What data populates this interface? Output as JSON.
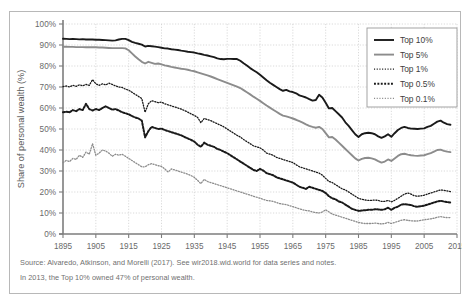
{
  "figure": {
    "ylabel": "Share of personal wealth (%)",
    "source_line": "Source: Alvaredo, Atkinson, and Morelli (2017). See wir2018.wid.world for data series and notes.",
    "note_line": "In 2013, the Top 10% owned 47% of personal wealth."
  },
  "colors": {
    "black": "#1a1a1a",
    "gray": "#8c8c8c",
    "grid": "#d0d0d0",
    "axis": "#7d7d7d",
    "frame": "#b8b8b8",
    "text": "#6a6a6a",
    "footnote": "#6f6f6f"
  },
  "legend": {
    "position": "top-right",
    "entries": [
      {
        "label": "Top 10%",
        "style": "solid-thick",
        "color": "#1a1a1a"
      },
      {
        "label": "Top 5%",
        "style": "solid-thick",
        "color": "#8c8c8c"
      },
      {
        "label": "Top 1%",
        "style": "fine-dotted",
        "color": "#1a1a1a"
      },
      {
        "label": "Top 0.5%",
        "style": "bold-dotted",
        "color": "#1a1a1a"
      },
      {
        "label": "Top 0.1%",
        "style": "fine-dotted",
        "color": "#8c8c8c"
      }
    ]
  },
  "chart_data": {
    "type": "line",
    "title": "",
    "xlabel": "",
    "ylabel": "Share of personal wealth (%)",
    "xlim": [
      1895,
      2015
    ],
    "ylim": [
      0,
      100
    ],
    "grid": true,
    "legend_position": "top-right",
    "xticks": [
      1895,
      1905,
      1915,
      1925,
      1935,
      1945,
      1955,
      1965,
      1975,
      1985,
      1995,
      2005,
      2015
    ],
    "ytick_labels": [
      "0%",
      "10%",
      "20%",
      "30%",
      "40%",
      "50%",
      "60%",
      "70%",
      "80%",
      "90%",
      "100%"
    ],
    "yticks": [
      0,
      10,
      20,
      30,
      40,
      50,
      60,
      70,
      80,
      90,
      100
    ],
    "x": [
      1895,
      1896,
      1897,
      1898,
      1899,
      1900,
      1901,
      1902,
      1903,
      1904,
      1905,
      1906,
      1907,
      1908,
      1909,
      1910,
      1911,
      1912,
      1913,
      1914,
      1915,
      1916,
      1917,
      1918,
      1919,
      1920,
      1921,
      1922,
      1923,
      1924,
      1925,
      1926,
      1927,
      1928,
      1929,
      1930,
      1931,
      1932,
      1933,
      1934,
      1935,
      1936,
      1937,
      1938,
      1939,
      1940,
      1941,
      1942,
      1943,
      1944,
      1945,
      1946,
      1947,
      1948,
      1949,
      1950,
      1951,
      1952,
      1953,
      1954,
      1955,
      1956,
      1957,
      1958,
      1959,
      1960,
      1961,
      1962,
      1963,
      1964,
      1965,
      1966,
      1967,
      1968,
      1969,
      1970,
      1971,
      1972,
      1973,
      1974,
      1975,
      1976,
      1977,
      1978,
      1979,
      1980,
      1981,
      1982,
      1983,
      1984,
      1985,
      1986,
      1987,
      1988,
      1989,
      1990,
      1991,
      1992,
      1993,
      1994,
      1995,
      1996,
      1997,
      1998,
      1999,
      2000,
      2001,
      2002,
      2003,
      2004,
      2005,
      2006,
      2007,
      2008,
      2009,
      2010,
      2011,
      2012,
      2013
    ],
    "series": [
      {
        "name": "Top 10%",
        "color": "#1a1a1a",
        "style": "solid-thick",
        "values": [
          93.0,
          92.9,
          92.8,
          92.9,
          92.8,
          92.7,
          92.8,
          92.6,
          92.6,
          92.6,
          92.5,
          92.5,
          92.4,
          92.3,
          92.2,
          92.1,
          92.2,
          92.6,
          92.9,
          92.9,
          92.3,
          91.5,
          91.0,
          90.6,
          90.2,
          89.3,
          89.6,
          89.4,
          89.2,
          89.0,
          88.7,
          88.4,
          88.3,
          88.0,
          87.8,
          87.6,
          87.3,
          87.1,
          86.8,
          86.6,
          86.4,
          86.0,
          85.7,
          85.3,
          85.0,
          84.6,
          84.2,
          83.6,
          83.3,
          83.2,
          83.4,
          83.4,
          83.3,
          83.3,
          82.5,
          81.3,
          80.2,
          79.0,
          78.0,
          77.0,
          75.8,
          74.5,
          73.2,
          72.0,
          71.0,
          70.0,
          69.0,
          68.2,
          68.6,
          67.9,
          67.6,
          67.0,
          66.0,
          65.5,
          65.0,
          64.2,
          63.5,
          63.8,
          66.3,
          65.0,
          62.5,
          59.8,
          60.0,
          58.5,
          57.0,
          55.5,
          53.2,
          51.5,
          49.5,
          47.5,
          46.2,
          47.5,
          48.0,
          48.2,
          48.0,
          47.5,
          46.5,
          45.8,
          46.5,
          47.5,
          46.3,
          48.0,
          49.5,
          50.5,
          51.0,
          50.5,
          50.2,
          50.1,
          50.0,
          50.2,
          50.3,
          51.0,
          51.5,
          52.5,
          53.5,
          54.0,
          53.0,
          52.3,
          52.0
        ]
      },
      {
        "name": "Top 5%",
        "color": "#8c8c8c",
        "style": "solid-thick",
        "values": [
          89.2,
          89.2,
          89.1,
          89.1,
          89.0,
          89.0,
          89.0,
          88.9,
          88.9,
          88.9,
          88.9,
          88.8,
          88.8,
          88.7,
          88.6,
          88.5,
          88.5,
          88.5,
          88.5,
          88.4,
          87.5,
          86.0,
          84.5,
          83.2,
          82.0,
          81.2,
          82.0,
          81.5,
          81.0,
          81.2,
          80.8,
          80.3,
          80.0,
          79.6,
          79.3,
          79.0,
          78.7,
          78.5,
          78.2,
          77.8,
          77.5,
          77.0,
          76.5,
          76.0,
          75.5,
          75.0,
          74.4,
          73.8,
          73.2,
          72.6,
          72.0,
          71.4,
          70.8,
          70.2,
          69.5,
          68.5,
          67.5,
          66.5,
          65.4,
          64.4,
          63.4,
          62.3,
          61.2,
          60.2,
          59.2,
          58.2,
          57.2,
          56.4,
          56.0,
          55.5,
          55.0,
          54.4,
          53.7,
          53.0,
          52.2,
          51.5,
          51.0,
          50.6,
          51.0,
          50.0,
          48.0,
          46.0,
          46.2,
          45.0,
          43.5,
          42.0,
          40.5,
          39.0,
          37.5,
          36.0,
          35.0,
          35.8,
          36.2,
          36.3,
          36.0,
          35.5,
          34.7,
          34.0,
          34.5,
          35.5,
          34.8,
          36.0,
          37.2,
          38.0,
          38.2,
          37.8,
          37.5,
          37.3,
          37.2,
          37.4,
          37.5,
          38.0,
          38.5,
          39.2,
          40.0,
          40.2,
          39.6,
          39.2,
          39.0
        ]
      },
      {
        "name": "Top 1%",
        "color": "#1a1a1a",
        "style": "fine-dotted",
        "values": [
          70.2,
          70.5,
          70.0,
          70.8,
          70.3,
          71.0,
          70.6,
          71.2,
          70.8,
          73.5,
          71.5,
          70.8,
          71.5,
          71.0,
          71.8,
          71.2,
          70.5,
          70.0,
          69.8,
          69.0,
          68.5,
          67.5,
          66.5,
          65.5,
          64.5,
          58.0,
          62.0,
          63.5,
          63.0,
          62.5,
          62.8,
          62.0,
          61.5,
          61.0,
          60.5,
          60.0,
          59.5,
          58.8,
          58.0,
          57.2,
          56.5,
          55.5,
          53.0,
          55.0,
          54.5,
          54.0,
          53.2,
          52.5,
          51.8,
          51.0,
          50.0,
          49.0,
          48.0,
          47.0,
          46.2,
          45.0,
          44.0,
          43.0,
          42.0,
          41.5,
          41.0,
          40.0,
          38.5,
          38.0,
          37.5,
          36.5,
          36.0,
          35.5,
          35.0,
          34.5,
          34.0,
          33.0,
          32.0,
          31.5,
          31.0,
          30.5,
          30.0,
          29.5,
          29.0,
          28.0,
          26.5,
          25.0,
          24.5,
          23.5,
          22.5,
          21.5,
          21.0,
          20.0,
          19.0,
          18.0,
          17.0,
          16.5,
          16.2,
          16.0,
          16.0,
          16.2,
          16.0,
          15.5,
          15.5,
          16.0,
          15.3,
          16.0,
          17.0,
          18.0,
          19.0,
          19.5,
          19.0,
          18.2,
          18.0,
          18.2,
          18.5,
          19.0,
          19.5,
          20.0,
          20.5,
          21.0,
          20.8,
          20.5,
          20.2
        ]
      },
      {
        "name": "Top 0.5%",
        "color": "#1a1a1a",
        "style": "bold-dotted",
        "values": [
          58.0,
          58.2,
          58.0,
          59.0,
          58.5,
          59.5,
          59.0,
          62.0,
          59.5,
          58.8,
          59.5,
          59.0,
          60.0,
          60.8,
          60.0,
          59.2,
          59.5,
          58.8,
          58.0,
          57.5,
          57.0,
          56.2,
          55.5,
          55.0,
          54.0,
          46.0,
          49.0,
          51.0,
          50.5,
          50.0,
          50.2,
          49.5,
          49.0,
          48.5,
          48.0,
          47.5,
          47.0,
          46.2,
          45.5,
          44.8,
          44.0,
          42.5,
          41.5,
          43.5,
          42.5,
          42.0,
          41.5,
          40.5,
          40.0,
          39.2,
          38.5,
          37.5,
          36.5,
          35.5,
          34.5,
          33.5,
          32.5,
          31.5,
          30.5,
          30.0,
          31.0,
          30.2,
          29.0,
          28.5,
          28.0,
          27.0,
          26.5,
          26.0,
          25.5,
          25.0,
          24.5,
          23.5,
          22.5,
          22.0,
          21.5,
          22.5,
          22.0,
          21.5,
          21.0,
          20.5,
          19.5,
          18.0,
          17.0,
          16.5,
          15.5,
          15.0,
          14.0,
          13.0,
          12.0,
          11.5,
          11.0,
          11.2,
          11.3,
          11.5,
          11.5,
          11.8,
          11.7,
          11.5,
          11.8,
          12.5,
          11.5,
          12.5,
          13.0,
          14.0,
          14.2,
          14.0,
          13.8,
          13.2,
          13.0,
          13.2,
          13.5,
          14.0,
          14.5,
          15.0,
          15.5,
          15.8,
          15.5,
          15.2,
          15.0
        ]
      },
      {
        "name": "Top 0.1%",
        "color": "#8c8c8c",
        "style": "fine-dotted",
        "values": [
          34.0,
          35.0,
          34.5,
          36.0,
          35.5,
          37.5,
          36.5,
          39.0,
          38.0,
          43.0,
          37.5,
          38.5,
          40.0,
          39.5,
          38.5,
          37.0,
          38.0,
          37.5,
          38.0,
          37.0,
          36.0,
          35.0,
          34.0,
          33.0,
          32.0,
          32.0,
          33.0,
          33.5,
          33.0,
          32.5,
          32.2,
          31.0,
          29.5,
          31.0,
          30.5,
          30.0,
          29.5,
          29.0,
          28.5,
          27.8,
          27.0,
          25.5,
          24.0,
          26.0,
          25.0,
          24.5,
          24.0,
          23.5,
          23.0,
          22.5,
          22.0,
          21.5,
          21.0,
          20.5,
          20.0,
          19.5,
          19.0,
          18.5,
          18.0,
          17.5,
          17.0,
          16.5,
          16.0,
          15.8,
          15.5,
          15.0,
          14.5,
          14.2,
          14.0,
          13.5,
          13.0,
          12.5,
          12.0,
          11.5,
          11.2,
          11.0,
          10.5,
          10.2,
          10.0,
          10.5,
          11.5,
          10.5,
          9.5,
          9.0,
          8.5,
          8.0,
          7.5,
          7.0,
          6.5,
          6.0,
          5.5,
          5.2,
          5.0,
          5.0,
          5.0,
          5.2,
          5.0,
          4.8,
          5.0,
          5.5,
          5.0,
          5.5,
          6.0,
          6.5,
          6.8,
          6.5,
          6.3,
          6.2,
          6.2,
          6.5,
          6.8,
          7.0,
          7.2,
          7.5,
          8.0,
          8.3,
          8.0,
          7.8,
          7.8
        ]
      }
    ]
  }
}
